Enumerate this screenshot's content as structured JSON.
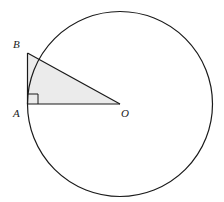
{
  "diagram": {
    "type": "geometry",
    "colors": {
      "stroke": "#1a1a1a",
      "fill_shaded": "#ebebeb",
      "background": "#ffffff"
    },
    "circle": {
      "center_label": "O",
      "cx": 120,
      "cy": 104,
      "r": 92.5
    },
    "points": {
      "A": {
        "label": "A",
        "x": 27.5,
        "y": 104
      },
      "B": {
        "label": "B",
        "x": 27.5,
        "y": 53
      },
      "O": {
        "label": "O",
        "x": 120,
        "y": 104
      }
    },
    "right_angle_marker": {
      "at": "A",
      "size": 10
    },
    "labels": {
      "A": "A",
      "B": "B",
      "O": "O"
    }
  }
}
